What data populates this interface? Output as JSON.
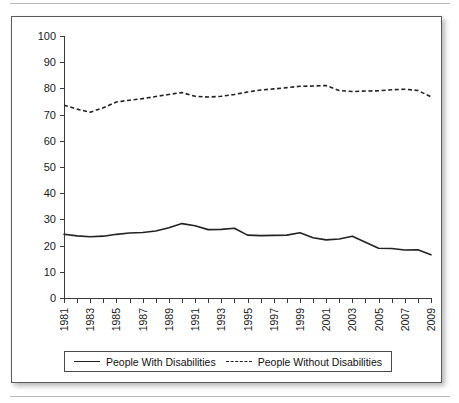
{
  "figure": {
    "border_color": "#5a5a5a",
    "background": "#ffffff"
  },
  "legend": {
    "position": "bottom",
    "entries": [
      {
        "label": "People With Disabilities",
        "style": "solid",
        "swatch": "solid-line-swatch"
      },
      {
        "label": "People Without Disabilities",
        "style": "dashed",
        "swatch": "dashed-line-swatch"
      }
    ]
  },
  "axes": {
    "y_ticks": [
      "100",
      "90",
      "80",
      "70",
      "60",
      "50",
      "40",
      "30",
      "20",
      "10",
      "0"
    ],
    "x_ticks_labeled": [
      "1981",
      "1983",
      "1985",
      "1987",
      "1989",
      "1991",
      "1993",
      "1995",
      "1997",
      "1999",
      "2001",
      "2003",
      "2005",
      "2007",
      "2009"
    ]
  },
  "chart_data": {
    "type": "line",
    "title": "",
    "subtitle": "",
    "xlabel": "",
    "ylabel": "",
    "xlim": [
      1981,
      2009
    ],
    "ylim": [
      0,
      100
    ],
    "ytick_step": 10,
    "grid": false,
    "legend_position": "bottom",
    "x": [
      1981,
      1982,
      1983,
      1984,
      1985,
      1986,
      1987,
      1988,
      1989,
      1990,
      1991,
      1992,
      1993,
      1994,
      1995,
      1996,
      1997,
      1998,
      1999,
      2000,
      2001,
      2002,
      2003,
      2004,
      2005,
      2006,
      2007,
      2008,
      2009
    ],
    "series": [
      {
        "name": "People With Disabilities",
        "style": "solid",
        "color": "#222222",
        "values": [
          24.3,
          23.7,
          23.4,
          23.6,
          24.3,
          24.8,
          25.0,
          25.6,
          26.8,
          28.4,
          27.6,
          26.1,
          26.2,
          26.6,
          24.0,
          23.8,
          23.9,
          24.0,
          24.9,
          23.0,
          22.2,
          22.5,
          23.6,
          21.3,
          19.0,
          18.9,
          18.3,
          18.4,
          16.5
        ]
      },
      {
        "name": "People Without Disabilities",
        "style": "dashed",
        "color": "#222222",
        "values": [
          73.6,
          72.1,
          70.9,
          72.6,
          74.8,
          75.5,
          76.1,
          76.9,
          77.7,
          78.4,
          77.0,
          76.7,
          77.0,
          77.7,
          78.6,
          79.4,
          79.8,
          80.3,
          80.8,
          80.9,
          81.1,
          79.2,
          78.8,
          79.0,
          79.1,
          79.5,
          79.7,
          79.2,
          76.8
        ]
      }
    ]
  }
}
